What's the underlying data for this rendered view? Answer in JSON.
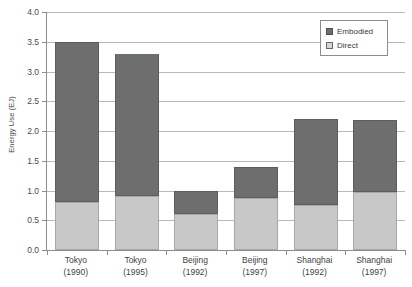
{
  "chart_data": {
    "type": "bar",
    "subtype": "stacked-bar",
    "title": "",
    "xlabel": "",
    "ylabel": "Energy Use (EJ)",
    "ylim": [
      0.0,
      4.0
    ],
    "ytick_step": 0.5,
    "grid": true,
    "legend_position": "top-right",
    "categories": [
      "Tokyo (1990)",
      "Tokyo (1995)",
      "Beijing (1992)",
      "Beijing (1997)",
      "Shanghai (1992)",
      "Shanghai (1997)"
    ],
    "category_lines": [
      {
        "line1": "Tokyo",
        "line2": "(1990)"
      },
      {
        "line1": "Tokyo",
        "line2": "(1995)"
      },
      {
        "line1": "Beijing",
        "line2": "(1992)"
      },
      {
        "line1": "Beijing",
        "line2": "(1997)"
      },
      {
        "line1": "Shanghai",
        "line2": "(1992)"
      },
      {
        "line1": "Shanghai",
        "line2": "(1997)"
      }
    ],
    "ytick_labels": [
      "0.0",
      "0.5",
      "1.0",
      "1.5",
      "2.0",
      "2.5",
      "3.0",
      "3.5",
      "4.0"
    ],
    "ytick_values": [
      0.0,
      0.5,
      1.0,
      1.5,
      2.0,
      2.5,
      3.0,
      3.5,
      4.0
    ],
    "series": [
      {
        "name": "Direct",
        "color": "#c8c8c8",
        "values": [
          0.8,
          0.9,
          0.6,
          0.87,
          0.75,
          0.97
        ]
      },
      {
        "name": "Embodied",
        "color": "#6e6e6e",
        "values": [
          2.7,
          2.4,
          0.4,
          0.53,
          1.45,
          1.21
        ]
      }
    ],
    "totals": [
      3.5,
      3.3,
      1.0,
      1.4,
      2.2,
      2.18
    ],
    "stack_order": [
      "Direct",
      "Embodied"
    ]
  },
  "legend": {
    "items": [
      {
        "label": "Embodied",
        "swatch": "embodied",
        "color": "#6e6e6e"
      },
      {
        "label": "Direct",
        "swatch": "direct",
        "color": "#d5d5d5"
      }
    ]
  },
  "colors": {
    "embodied": "#6e6e6e",
    "direct": "#c8c8c8",
    "axis": "#8d8d8d",
    "gridline": "#b9b9b9",
    "text": "#3a3a3a",
    "background": "#ffffff"
  }
}
